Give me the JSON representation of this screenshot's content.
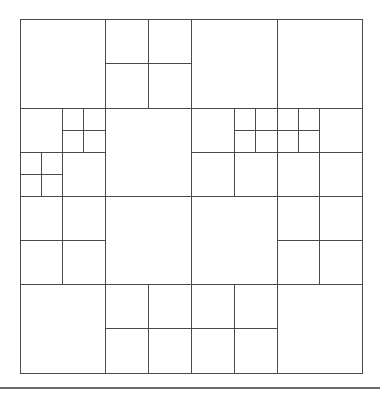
{
  "diagram": {
    "title": "",
    "canvas": {
      "width": 380,
      "height": 393
    },
    "line_color": "#4a4a4a",
    "bounds": {
      "x": 20,
      "y": 19,
      "w": 342,
      "h": 354
    },
    "cells": [
      {
        "x": 20,
        "y": 19,
        "w": 85,
        "h": 89
      },
      {
        "x": 105,
        "y": 19,
        "w": 43,
        "h": 44
      },
      {
        "x": 148,
        "y": 19,
        "w": 43,
        "h": 44
      },
      {
        "x": 105,
        "y": 63,
        "w": 43,
        "h": 45
      },
      {
        "x": 148,
        "y": 63,
        "w": 43,
        "h": 45
      },
      {
        "x": 191,
        "y": 19,
        "w": 86,
        "h": 89
      },
      {
        "x": 277,
        "y": 19,
        "w": 85,
        "h": 89
      },
      {
        "x": 20,
        "y": 108,
        "w": 42,
        "h": 44
      },
      {
        "x": 62,
        "y": 108,
        "w": 21,
        "h": 22
      },
      {
        "x": 83,
        "y": 108,
        "w": 22,
        "h": 22
      },
      {
        "x": 62,
        "y": 130,
        "w": 21,
        "h": 22
      },
      {
        "x": 83,
        "y": 130,
        "w": 22,
        "h": 22
      },
      {
        "x": 20,
        "y": 152,
        "w": 21,
        "h": 22
      },
      {
        "x": 41,
        "y": 152,
        "w": 21,
        "h": 22
      },
      {
        "x": 20,
        "y": 174,
        "w": 21,
        "h": 22
      },
      {
        "x": 41,
        "y": 174,
        "w": 21,
        "h": 22
      },
      {
        "x": 62,
        "y": 152,
        "w": 43,
        "h": 44
      },
      {
        "x": 105,
        "y": 108,
        "w": 86,
        "h": 88
      },
      {
        "x": 191,
        "y": 108,
        "w": 43,
        "h": 44
      },
      {
        "x": 234,
        "y": 108,
        "w": 21,
        "h": 22
      },
      {
        "x": 255,
        "y": 108,
        "w": 22,
        "h": 22
      },
      {
        "x": 234,
        "y": 130,
        "w": 21,
        "h": 22
      },
      {
        "x": 255,
        "y": 130,
        "w": 22,
        "h": 22
      },
      {
        "x": 191,
        "y": 152,
        "w": 43,
        "h": 44
      },
      {
        "x": 234,
        "y": 152,
        "w": 43,
        "h": 44
      },
      {
        "x": 277,
        "y": 108,
        "w": 21,
        "h": 22
      },
      {
        "x": 298,
        "y": 108,
        "w": 21,
        "h": 22
      },
      {
        "x": 277,
        "y": 130,
        "w": 21,
        "h": 22
      },
      {
        "x": 298,
        "y": 130,
        "w": 21,
        "h": 22
      },
      {
        "x": 319,
        "y": 108,
        "w": 43,
        "h": 44
      },
      {
        "x": 277,
        "y": 152,
        "w": 42,
        "h": 44
      },
      {
        "x": 319,
        "y": 152,
        "w": 43,
        "h": 44
      },
      {
        "x": 20,
        "y": 196,
        "w": 42,
        "h": 44
      },
      {
        "x": 62,
        "y": 196,
        "w": 43,
        "h": 44
      },
      {
        "x": 20,
        "y": 240,
        "w": 42,
        "h": 44
      },
      {
        "x": 62,
        "y": 240,
        "w": 43,
        "h": 44
      },
      {
        "x": 105,
        "y": 196,
        "w": 86,
        "h": 88
      },
      {
        "x": 20,
        "y": 284,
        "w": 85,
        "h": 89
      },
      {
        "x": 105,
        "y": 284,
        "w": 43,
        "h": 44
      },
      {
        "x": 148,
        "y": 284,
        "w": 43,
        "h": 44
      },
      {
        "x": 105,
        "y": 328,
        "w": 43,
        "h": 45
      },
      {
        "x": 148,
        "y": 328,
        "w": 43,
        "h": 45
      },
      {
        "x": 191,
        "y": 196,
        "w": 86,
        "h": 88
      },
      {
        "x": 277,
        "y": 196,
        "w": 42,
        "h": 44
      },
      {
        "x": 319,
        "y": 196,
        "w": 43,
        "h": 44
      },
      {
        "x": 277,
        "y": 240,
        "w": 42,
        "h": 44
      },
      {
        "x": 319,
        "y": 240,
        "w": 43,
        "h": 44
      },
      {
        "x": 191,
        "y": 284,
        "w": 43,
        "h": 44
      },
      {
        "x": 234,
        "y": 284,
        "w": 43,
        "h": 44
      },
      {
        "x": 191,
        "y": 328,
        "w": 43,
        "h": 45
      },
      {
        "x": 234,
        "y": 328,
        "w": 43,
        "h": 45
      },
      {
        "x": 277,
        "y": 284,
        "w": 85,
        "h": 89
      }
    ],
    "bottom_rule": {
      "x1": 0,
      "y1": 388,
      "x2": 380,
      "y2": 388
    }
  }
}
